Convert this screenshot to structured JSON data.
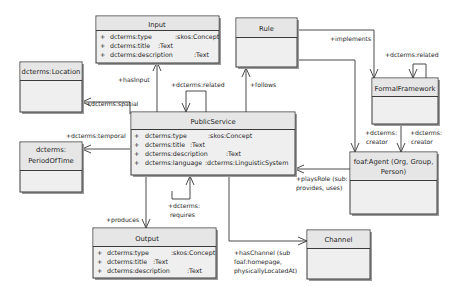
{
  "classes": {
    "input": {
      "name": "Input",
      "attributes": [
        {
          "vis": "+",
          "name": "dcterms:type",
          "type": ":skos:Concept"
        },
        {
          "vis": "+",
          "name": "dcterms:title",
          "type": ":Text"
        },
        {
          "vis": "+",
          "name": "dcterms:description",
          "type": ":Text"
        }
      ]
    },
    "rule": {
      "name": "Rule",
      "attributes": []
    },
    "location": {
      "name": "dcterms:Location",
      "attributes": []
    },
    "period": {
      "name_line1": "dcterms:",
      "name_line2": "PeriodOfTime",
      "attributes": []
    },
    "public_service": {
      "name": "PublicService",
      "attributes": [
        {
          "vis": "+",
          "name": "dcterms:type",
          "type": ":skos:Concept"
        },
        {
          "vis": "+",
          "name": "dcterms:title",
          "type": ":Text"
        },
        {
          "vis": "+",
          "name": "dcterms:description",
          "type": ":Text"
        },
        {
          "vis": "+",
          "name": "dcterms:language",
          "type": ":dcterms:LinguisticSystem"
        }
      ]
    },
    "formal_framework": {
      "name": "FormalFramework",
      "attributes": []
    },
    "agent": {
      "name_line1": "foaf:Agent (Org, Group,",
      "name_line2": "Person)",
      "attributes": []
    },
    "output": {
      "name": "Output",
      "attributes": [
        {
          "vis": "+",
          "name": "dcterms:type",
          "type": ":skos:Concept"
        },
        {
          "vis": "+",
          "name": "dcterms:title",
          "type": ":Text"
        },
        {
          "vis": "+",
          "name": "dcterms:description",
          "type": ":Text"
        }
      ]
    },
    "channel": {
      "name": "Channel",
      "attributes": []
    }
  },
  "associations": {
    "has_input": "+hasInput",
    "related_ps": "+dcterms:related",
    "spatial": "+dcterms:spatial",
    "temporal": "+dcterms:temporal",
    "follows": "+follows",
    "implements": "+implements",
    "related_ff": "+dcterms:related",
    "creator_1_l1": "+dcterms:",
    "creator_1_l2": "creator",
    "creator_2_l1": "+dcterms:",
    "creator_2_l2": "creator",
    "plays_role_l1": "+playsRole (sub:",
    "plays_role_l2": "provides, uses)",
    "requires_l1": "+dcterms:",
    "requires_l2": "requires",
    "produces": "+produces",
    "has_channel_l1": "+hasChannel (sub",
    "has_channel_l2": "foaf:homepage,",
    "has_channel_l3": "physicallyLocatedAt)"
  }
}
